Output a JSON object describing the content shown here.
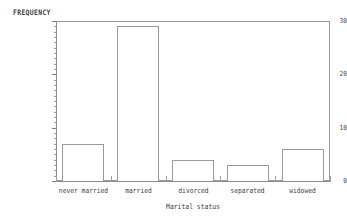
{
  "chart_data": {
    "type": "bar",
    "title": "",
    "xlabel": "Marital status",
    "ylabel": "FREQUENCY",
    "categories": [
      "never married",
      "married",
      "divorced",
      "separated",
      "widowed"
    ],
    "values": [
      7,
      29,
      4,
      3,
      6
    ],
    "ylim": [
      0,
      30
    ],
    "ytick_labels": [
      "0",
      "10",
      "20",
      "30"
    ],
    "ytick_values": [
      0,
      10,
      20,
      30
    ],
    "minor_tick_step": 1,
    "grid": false,
    "legend": null,
    "bar_style": {
      "fill": "#ffffff",
      "edge": "#9a9a9a"
    },
    "frame_color": "#9a9a9a",
    "background": "#ffffff",
    "text_color": "#3f3f3f"
  },
  "axes": {
    "y_title": "FREQUENCY",
    "x_title": "Marital status"
  }
}
